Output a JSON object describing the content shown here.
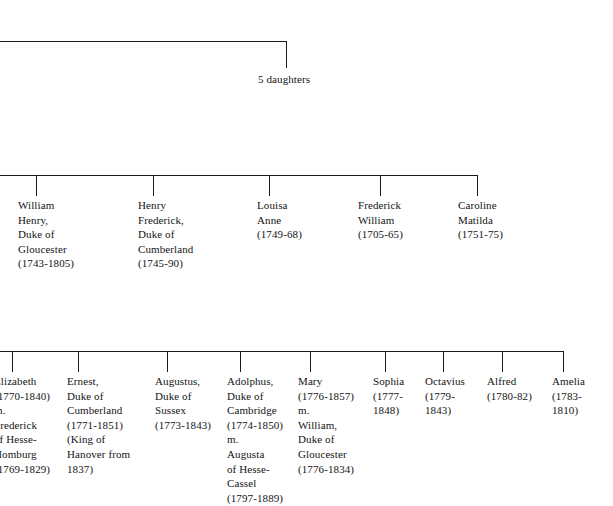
{
  "diagram": {
    "line_color": "#1a1a1a",
    "text_color": "#141414",
    "background": "#ffffff"
  },
  "top_branch": {
    "caption": "5 daughters"
  },
  "generation_two": {
    "nodes": [
      {
        "text": "William\nHenry,\nDuke of\nGloucester\n(1743-1805)"
      },
      {
        "text": "Henry\nFrederick,\nDuke of\nCumberland\n(1745-90)"
      },
      {
        "text": "Louisa\nAnne\n(1749-68)"
      },
      {
        "text": "Frederick\nWilliam\n(1705-65)"
      },
      {
        "text": "Caroline\nMatilda\n(1751-75)"
      }
    ]
  },
  "generation_three": {
    "nodes": [
      {
        "text": "Elizabeth\n(1770-1840)\nm.\nFrederick\nof Hesse-\nHomburg\n(1769-1829)"
      },
      {
        "text": "Ernest,\nDuke of\nCumberland\n(1771-1851)\n(King of\nHanover from\n1837)"
      },
      {
        "text": "Augustus,\nDuke of\nSussex\n(1773-1843)"
      },
      {
        "text": "Adolphus,\nDuke of\nCambridge\n(1774-1850)\nm.\nAugusta\nof Hesse-\nCassel\n(1797-1889)"
      },
      {
        "text": "Mary\n(1776-1857)\nm.\nWilliam,\nDuke of\nGloucester\n(1776-1834)"
      },
      {
        "text": "Sophia\n(1777-1848)"
      },
      {
        "text": "Octavius\n(1779-1843)"
      },
      {
        "text": "Alfred\n(1780-82)"
      },
      {
        "text": "Amelia\n(1783-1810)"
      }
    ]
  }
}
